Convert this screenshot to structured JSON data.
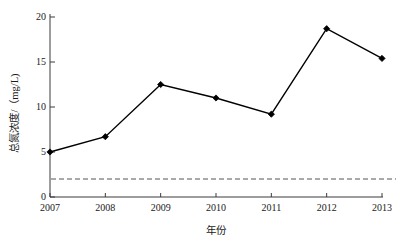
{
  "chart_data": {
    "type": "line",
    "title": "",
    "subtitle": "",
    "xlabel": "年份",
    "ylabel": "总氮浓度/（mg/L)",
    "categories": [
      "2007",
      "2008",
      "2009",
      "2010",
      "2011",
      "2012",
      "2013"
    ],
    "x": [
      2007,
      2008,
      2009,
      2010,
      2011,
      2012,
      2013
    ],
    "series": [
      {
        "name": "总氮浓度",
        "values": [
          5.0,
          6.7,
          12.5,
          11.0,
          9.2,
          18.7,
          15.4
        ],
        "color": "#000000",
        "marker": "diamond",
        "line_style": "solid"
      }
    ],
    "reference_lines": [
      {
        "name": "标准限值",
        "orientation": "horizontal",
        "value": 2.0,
        "line_style": "dashed",
        "color": "#555555"
      }
    ],
    "ylim": [
      0,
      20
    ],
    "yticks": [
      0,
      5,
      10,
      15,
      20
    ],
    "ytick_labels": [
      "0",
      "5",
      "10",
      "15",
      "20"
    ],
    "xtick_labels": [
      "2007",
      "2008",
      "2009",
      "2010",
      "2011",
      "2012",
      "2013"
    ],
    "grid": false,
    "legend": null,
    "legend_position": "none",
    "axis_color": "#3a3a3a",
    "background": "#ffffff"
  },
  "figure": {
    "y_axis_title": "总氮浓度/（mg/L)",
    "x_axis_title": "年份"
  }
}
